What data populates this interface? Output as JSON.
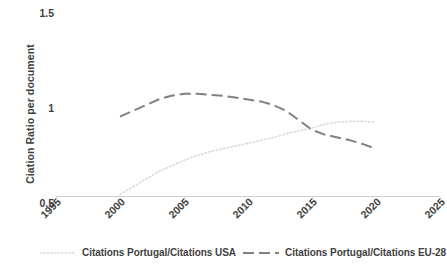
{
  "chart_data": {
    "type": "line",
    "title": "",
    "xlabel": "",
    "ylabel": "Ciation Ratio per document",
    "xlim": [
      1995,
      2025
    ],
    "ylim": [
      0.5,
      1.5
    ],
    "xticks": [
      "1995",
      "2000",
      "2005",
      "2010",
      "2015",
      "2020",
      "2025"
    ],
    "yticks": [
      "0.5",
      "1",
      "1.5"
    ],
    "grid": false,
    "legend_position": "bottom",
    "series": [
      {
        "name": "Citations Portugal/Citations USA",
        "color": "#d9d9d9",
        "style": "dotted",
        "x": [
          2000,
          2001,
          2002,
          2003,
          2004,
          2005,
          2006,
          2007,
          2008,
          2009,
          2010,
          2011,
          2012,
          2013,
          2014,
          2015,
          2016,
          2017,
          2018,
          2019,
          2020
        ],
        "values": [
          0.55,
          0.59,
          0.63,
          0.67,
          0.7,
          0.73,
          0.755,
          0.775,
          0.79,
          0.805,
          0.82,
          0.835,
          0.85,
          0.87,
          0.885,
          0.9,
          0.92,
          0.93,
          0.935,
          0.935,
          0.93
        ]
      },
      {
        "name": "Citations Portugal/Citations EU-28",
        "color": "#808080",
        "style": "dashed",
        "x": [
          2000,
          2001,
          2002,
          2003,
          2004,
          2005,
          2006,
          2007,
          2008,
          2009,
          2010,
          2011,
          2012,
          2013,
          2014,
          2015,
          2016,
          2017,
          2018,
          2019,
          2020
        ],
        "values": [
          0.96,
          0.99,
          1.02,
          1.05,
          1.07,
          1.08,
          1.08,
          1.075,
          1.07,
          1.06,
          1.05,
          1.04,
          1.02,
          0.99,
          0.94,
          0.89,
          0.865,
          0.85,
          0.835,
          0.815,
          0.79
        ]
      }
    ]
  },
  "legend": {
    "entries": [
      {
        "label": "Citations Portugal/Citations USA"
      },
      {
        "label": "Citations Portugal/Citations EU-28"
      }
    ]
  }
}
